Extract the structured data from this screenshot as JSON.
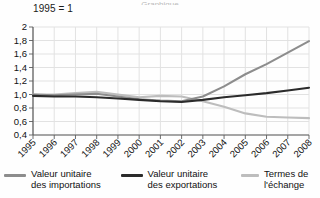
{
  "title_sliver": "Graphique",
  "index_note": "1995 = 1",
  "legend": {
    "items": [
      {
        "line1": "Valeur unitaire",
        "line2": "des importations",
        "color": "#8d8d8d"
      },
      {
        "line1": "Valeur unitaire",
        "line2": "des exportations",
        "color": "#2b2b2b"
      },
      {
        "line1": "Termes de",
        "line2": "l'échange",
        "color": "#bdbdbd"
      }
    ]
  },
  "chart_data": {
    "type": "line",
    "title": "",
    "subtitle": "1995 = 1",
    "xlabel": "",
    "ylabel": "",
    "grid": true,
    "legend_position": "bottom",
    "categories": [
      "1995",
      "1996",
      "1997",
      "1998",
      "1999",
      "2000",
      "2001",
      "2002",
      "2003",
      "2004",
      "2005",
      "2006",
      "2007",
      "2008"
    ],
    "ylim": [
      0.4,
      2.0
    ],
    "yticks": [
      0.4,
      0.6,
      0.8,
      1.0,
      1.2,
      1.4,
      1.6,
      1.8,
      2.0
    ],
    "ytick_labels": [
      "0,4",
      "0,6",
      "0,8",
      "1,0",
      "1,2",
      "1,4",
      "1,6",
      "1,8",
      "2"
    ],
    "series": [
      {
        "name": "Valeur unitaire des importations",
        "color": "#8d8d8d",
        "values": [
          1.0,
          0.99,
          1.0,
          1.01,
          0.97,
          0.93,
          0.91,
          0.9,
          0.97,
          1.12,
          1.3,
          1.45,
          1.62,
          1.79
        ]
      },
      {
        "name": "Valeur unitaire des exportations",
        "color": "#2b2b2b",
        "values": [
          0.98,
          0.97,
          0.97,
          0.96,
          0.94,
          0.92,
          0.9,
          0.89,
          0.92,
          0.96,
          0.99,
          1.02,
          1.06,
          1.1
        ]
      },
      {
        "name": "Termes de l'échange",
        "color": "#bdbdbd",
        "values": [
          1.0,
          1.0,
          1.02,
          1.04,
          1.0,
          0.96,
          0.98,
          0.97,
          0.9,
          0.82,
          0.72,
          0.67,
          0.66,
          0.65
        ]
      }
    ]
  }
}
